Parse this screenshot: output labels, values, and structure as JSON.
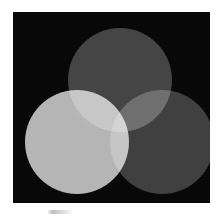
{
  "figure": {
    "panel_background": "#070707",
    "page_background": "#ffffff",
    "caption_text": ""
  },
  "chart_data": {
    "type": "venn",
    "subtitle": "",
    "xlabel": "",
    "ylabel": "",
    "blend_mode": "screen",
    "background": "#070707",
    "sets": [
      {
        "name": "top",
        "label": "",
        "fill": "#3f3f3f",
        "center_x": 107,
        "center_y": 68,
        "radius": 52
      },
      {
        "name": "left",
        "label": "",
        "fill": "#b4b4b4",
        "center_x": 64,
        "center_y": 130,
        "radius": 52
      },
      {
        "name": "right",
        "label": "",
        "fill": "#3a3a3a",
        "center_x": 149,
        "center_y": 130,
        "radius": 52
      }
    ],
    "regions": [
      {
        "name": "top-only",
        "color": "#3f3f3f"
      },
      {
        "name": "left-only",
        "color": "#b4b4b4"
      },
      {
        "name": "right-only",
        "color": "#3a3a3a"
      },
      {
        "name": "top-and-left",
        "color": "#d4d4d4"
      },
      {
        "name": "top-and-right",
        "color": "#6e6e6e"
      },
      {
        "name": "left-and-right",
        "color": "#e0e0e0"
      },
      {
        "name": "all-three",
        "color": "#ffffff"
      }
    ],
    "legend_position": "none",
    "grid": false
  }
}
